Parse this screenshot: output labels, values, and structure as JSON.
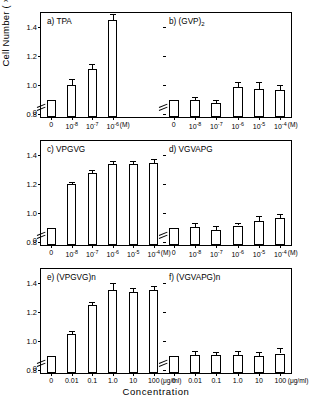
{
  "figure": {
    "ylabel_text": "Cell Number ( ×10",
    "ylabel_exp": "5",
    "ylabel_tail": "/Dish)",
    "xlabel": "Concentration",
    "yticks": [
      "1.4",
      "1.2",
      "1.0",
      "0.8"
    ],
    "zero_label": "0"
  },
  "chart_data": {
    "type": "bar",
    "xlabel": "Concentration",
    "ylabel": "Cell Number ( ×10^5/Dish)",
    "ylim": [
      0.78,
      1.5
    ],
    "ytick_values": [
      1.4,
      1.2,
      1.0,
      0.8
    ],
    "grid": false,
    "legend": "none",
    "axis_note": "y-axis broken below 0.8",
    "panels": [
      {
        "id": "a",
        "label": "a)  TPA",
        "name": "TPA",
        "unit": "(M)",
        "categories": [
          "0",
          "10-8",
          "10-7",
          "10-6"
        ],
        "category_labels": [
          {
            "base": "0",
            "exp": ""
          },
          {
            "base": "10",
            "exp": "-8"
          },
          {
            "base": "10",
            "exp": "-7"
          },
          {
            "base": "10",
            "exp": "-6"
          }
        ],
        "values": [
          0.9,
          1.0,
          1.11,
          1.45
        ],
        "errors": [
          0.0,
          0.045,
          0.035,
          0.04
        ],
        "n_slots": 6
      },
      {
        "id": "b",
        "label": "b)  (GVP)2",
        "name": "(GVP)2",
        "label_base": "b)  (GVP)",
        "label_sub": "2",
        "unit": "(M)",
        "categories": [
          "0",
          "10-8",
          "10-7",
          "10-6",
          "10-5",
          "10-4"
        ],
        "category_labels": [
          {
            "base": "0",
            "exp": ""
          },
          {
            "base": "10",
            "exp": "-8"
          },
          {
            "base": "10",
            "exp": "-7"
          },
          {
            "base": "10",
            "exp": "-6"
          },
          {
            "base": "10",
            "exp": "-5"
          },
          {
            "base": "10",
            "exp": "-4"
          }
        ],
        "values": [
          0.9,
          0.895,
          0.875,
          0.99,
          0.975,
          0.965
        ],
        "errors": [
          0.0,
          0.025,
          0.02,
          0.035,
          0.05,
          0.04
        ],
        "n_slots": 6
      },
      {
        "id": "c",
        "label": "c)  VPGVG",
        "name": "VPGVG",
        "unit": "(M)",
        "categories": [
          "0",
          "10-8",
          "10-7",
          "10-6",
          "10-5",
          "10-4"
        ],
        "category_labels": [
          {
            "base": "0",
            "exp": ""
          },
          {
            "base": "10",
            "exp": "-8"
          },
          {
            "base": "10",
            "exp": "-7"
          },
          {
            "base": "10",
            "exp": "-6"
          },
          {
            "base": "10",
            "exp": "-5"
          },
          {
            "base": "10",
            "exp": "-4"
          }
        ],
        "values": [
          0.9,
          1.2,
          1.28,
          1.34,
          1.34,
          1.35
        ],
        "errors": [
          0.0,
          0.015,
          0.02,
          0.02,
          0.02,
          0.025
        ],
        "n_slots": 6
      },
      {
        "id": "d",
        "label": "d)  VGVAPG",
        "name": "VGVAPG",
        "unit": "(M)",
        "categories": [
          "0",
          "10-8",
          "10-7",
          "10-6",
          "10-5",
          "10-4"
        ],
        "category_labels": [
          {
            "base": "0",
            "exp": ""
          },
          {
            "base": "10",
            "exp": "-8"
          },
          {
            "base": "10",
            "exp": "-7"
          },
          {
            "base": "10",
            "exp": "-6"
          },
          {
            "base": "10",
            "exp": "-5"
          },
          {
            "base": "10",
            "exp": "-4"
          }
        ],
        "values": [
          0.9,
          0.905,
          0.885,
          0.915,
          0.945,
          0.965
        ],
        "errors": [
          0.0,
          0.025,
          0.03,
          0.02,
          0.035,
          0.03
        ],
        "n_slots": 6
      },
      {
        "id": "e",
        "label": "e)  (VPGVG)n",
        "name": "(VPGVG)n",
        "unit": "(μg/ml)",
        "categories": [
          "0",
          "0.01",
          "0.1",
          "1.0",
          "10",
          "100"
        ],
        "category_labels": [
          {
            "base": "0",
            "exp": ""
          },
          {
            "base": "0.01",
            "exp": ""
          },
          {
            "base": "0.1",
            "exp": ""
          },
          {
            "base": "1.0",
            "exp": ""
          },
          {
            "base": "10",
            "exp": ""
          },
          {
            "base": "100",
            "exp": ""
          }
        ],
        "values": [
          0.9,
          1.05,
          1.25,
          1.355,
          1.34,
          1.355
        ],
        "errors": [
          0.0,
          0.02,
          0.02,
          0.045,
          0.03,
          0.025
        ],
        "n_slots": 6
      },
      {
        "id": "f",
        "label": "f)  (VGVAPG)n",
        "name": "(VGVAPG)n",
        "unit": "(μg/ml)",
        "categories": [
          "0",
          "0.01",
          "0.1",
          "1.0",
          "10",
          "100"
        ],
        "category_labels": [
          {
            "base": "0",
            "exp": ""
          },
          {
            "base": "0.01",
            "exp": ""
          },
          {
            "base": "0.1",
            "exp": ""
          },
          {
            "base": "1.0",
            "exp": ""
          },
          {
            "base": "10",
            "exp": ""
          },
          {
            "base": "100",
            "exp": ""
          }
        ],
        "values": [
          0.9,
          0.905,
          0.905,
          0.905,
          0.9,
          0.915
        ],
        "errors": [
          0.0,
          0.03,
          0.02,
          0.025,
          0.025,
          0.04
        ],
        "n_slots": 6
      }
    ]
  }
}
